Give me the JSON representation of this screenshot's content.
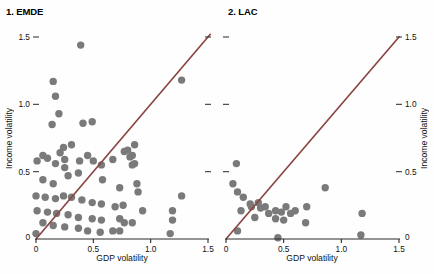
{
  "figure": {
    "bg_color": "#fefefe",
    "dot_color": "#7a7a7a",
    "line_color": "#8b4744",
    "axis_color": "#2b2b2b",
    "dot_radius": 3.7
  },
  "chart_data": [
    {
      "type": "scatter",
      "title": "1. EMDE",
      "xlabel": "GDP volatility",
      "ylabel": "Income volatility",
      "ylabel_side": "left",
      "xlim": [
        0,
        1.5
      ],
      "ylim": [
        0,
        1.5
      ],
      "xticks": [
        0,
        0.5,
        1.0,
        1.5
      ],
      "yticks": [
        0,
        0.5,
        1.0,
        1.5
      ],
      "tick_labels": [
        "0",
        "0.5",
        "1.0",
        "1.5"
      ],
      "grid": false,
      "reference_line": {
        "name": "45-degree line",
        "from": [
          0,
          0
        ],
        "to": [
          1.52,
          1.52
        ]
      },
      "points": [
        [
          0.39,
          1.44
        ],
        [
          0.15,
          1.17
        ],
        [
          0.17,
          1.06
        ],
        [
          0.2,
          0.93
        ],
        [
          0.14,
          0.85
        ],
        [
          0.41,
          0.86
        ],
        [
          0.49,
          0.87
        ],
        [
          1.27,
          1.18
        ],
        [
          0.24,
          0.68
        ],
        [
          0.31,
          0.7
        ],
        [
          0.86,
          0.7
        ],
        [
          0.8,
          0.66
        ],
        [
          0.84,
          0.62
        ],
        [
          0.86,
          0.56
        ],
        [
          0.01,
          0.58
        ],
        [
          0.06,
          0.62
        ],
        [
          0.1,
          0.6
        ],
        [
          0.17,
          0.56
        ],
        [
          0.21,
          0.64
        ],
        [
          0.25,
          0.59
        ],
        [
          0.38,
          0.58
        ],
        [
          0.45,
          0.62
        ],
        [
          0.5,
          0.58
        ],
        [
          0.57,
          0.55
        ],
        [
          0.67,
          0.59
        ],
        [
          0.77,
          0.65
        ],
        [
          0.82,
          0.61
        ],
        [
          0.84,
          0.55
        ],
        [
          0.25,
          0.53
        ],
        [
          0.28,
          0.47
        ],
        [
          0.37,
          0.49
        ],
        [
          0.06,
          0.44
        ],
        [
          0.15,
          0.41
        ],
        [
          0.58,
          0.44
        ],
        [
          0.73,
          0.38
        ],
        [
          0.88,
          0.41
        ],
        [
          0.89,
          0.35
        ],
        [
          0.0,
          0.32
        ],
        [
          0.08,
          0.31
        ],
        [
          0.17,
          0.3
        ],
        [
          0.24,
          0.32
        ],
        [
          0.31,
          0.31
        ],
        [
          0.4,
          0.29
        ],
        [
          0.49,
          0.27
        ],
        [
          0.57,
          0.26
        ],
        [
          0.69,
          0.24
        ],
        [
          0.76,
          0.25
        ],
        [
          0.93,
          0.21
        ],
        [
          1.27,
          0.32
        ],
        [
          0.01,
          0.21
        ],
        [
          0.1,
          0.2
        ],
        [
          0.18,
          0.19
        ],
        [
          0.28,
          0.18
        ],
        [
          0.37,
          0.16
        ],
        [
          0.49,
          0.15
        ],
        [
          0.57,
          0.14
        ],
        [
          0.73,
          0.15
        ],
        [
          1.19,
          0.21
        ],
        [
          0.06,
          0.12
        ],
        [
          0.15,
          0.1
        ],
        [
          0.25,
          0.09
        ],
        [
          0.37,
          0.08
        ],
        [
          0.45,
          0.06
        ],
        [
          0.56,
          0.05
        ],
        [
          0.67,
          0.06
        ],
        [
          0.77,
          0.12
        ],
        [
          0.84,
          0.12
        ],
        [
          0.73,
          0.06
        ],
        [
          0.0,
          0.04
        ],
        [
          1.19,
          0.14
        ],
        [
          1.17,
          0.04
        ]
      ]
    },
    {
      "type": "scatter",
      "title": "2. LAC",
      "xlabel": "GDP volatility",
      "ylabel": "Income volatility",
      "ylabel_side": "right",
      "xlim": [
        0,
        1.5
      ],
      "ylim": [
        0,
        1.5
      ],
      "xticks": [
        0,
        0.5,
        1.0,
        1.5
      ],
      "yticks": [
        0,
        0.5,
        1.0,
        1.5
      ],
      "tick_labels": [
        "0",
        "0.5",
        "1.0",
        "1.5"
      ],
      "grid": false,
      "reference_line": {
        "name": "45-degree line",
        "from": [
          0,
          0
        ],
        "to": [
          1.5,
          1.5
        ]
      },
      "points": [
        [
          0.09,
          0.56
        ],
        [
          0.06,
          0.41
        ],
        [
          0.1,
          0.35
        ],
        [
          0.15,
          0.31
        ],
        [
          0.21,
          0.26
        ],
        [
          0.13,
          0.21
        ],
        [
          0.22,
          0.24
        ],
        [
          0.28,
          0.27
        ],
        [
          0.3,
          0.23
        ],
        [
          0.34,
          0.24
        ],
        [
          0.25,
          0.16
        ],
        [
          0.37,
          0.19
        ],
        [
          0.43,
          0.21
        ],
        [
          0.48,
          0.2
        ],
        [
          0.52,
          0.24
        ],
        [
          0.56,
          0.19
        ],
        [
          0.6,
          0.21
        ],
        [
          0.43,
          0.15
        ],
        [
          0.5,
          0.14
        ],
        [
          0.1,
          0.06
        ],
        [
          0.45,
          0.01
        ],
        [
          0.86,
          0.38
        ],
        [
          0.7,
          0.24
        ],
        [
          0.69,
          0.12
        ],
        [
          1.18,
          0.19
        ],
        [
          1.17,
          0.03
        ]
      ]
    }
  ]
}
